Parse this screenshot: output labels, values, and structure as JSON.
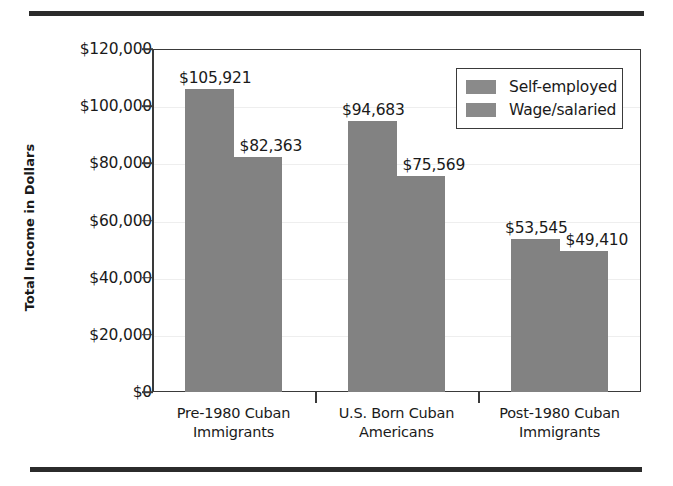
{
  "page": {
    "clipped_header_text": ""
  },
  "chart_data": {
    "type": "bar",
    "title": "",
    "xlabel": "",
    "ylabel": "Total Income in Dollars",
    "ylim": [
      0,
      120000
    ],
    "ytick_values": [
      0,
      20000,
      40000,
      60000,
      80000,
      100000,
      120000
    ],
    "ytick_labels": [
      "$0",
      "$20,000",
      "$40,000",
      "$60,000",
      "$80,000",
      "$100,000",
      "$120,000"
    ],
    "grid": true,
    "legend_position": "upper right",
    "bar_color": "#828282",
    "categories": [
      "Pre-1980 Cuban Immigrants",
      "U.S. Born Cuban Americans",
      "Post-1980 Cuban Immigrants"
    ],
    "category_lines": [
      [
        "Pre-1980 Cuban",
        "Immigrants"
      ],
      [
        "U.S. Born Cuban",
        "Americans"
      ],
      [
        "Post-1980 Cuban",
        "Immigrants"
      ]
    ],
    "series": [
      {
        "name": "Self-employed",
        "values": [
          105921,
          94683,
          53545
        ],
        "value_labels": [
          "$105,921",
          "$94,683",
          "$53,545"
        ]
      },
      {
        "name": "Wage/salaried",
        "values": [
          82363,
          75569,
          49410
        ],
        "value_labels": [
          "$82,363",
          "$75,569",
          "$49,410"
        ]
      }
    ]
  },
  "legend": {
    "items": [
      {
        "label": "Self-employed",
        "color": "#8a8a8a"
      },
      {
        "label": "Wage/salaried",
        "color": "#8a8a8a"
      }
    ]
  }
}
